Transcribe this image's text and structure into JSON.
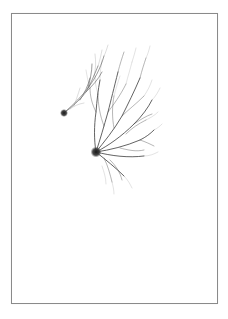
{
  "image": {
    "description": "Drawing of two neuron-like cells with branching dendrites inside a thin rectangular frame on white paper",
    "background": "#ffffff",
    "frame_color": "#8a8a8a",
    "ink_color": "#2a2a2a",
    "cells": [
      {
        "name": "large-neuron",
        "soma_x": 96,
        "soma_y": 152,
        "soma_r": 5
      },
      {
        "name": "small-neuron",
        "soma_x": 64,
        "soma_y": 113,
        "soma_r": 3.5
      }
    ]
  }
}
